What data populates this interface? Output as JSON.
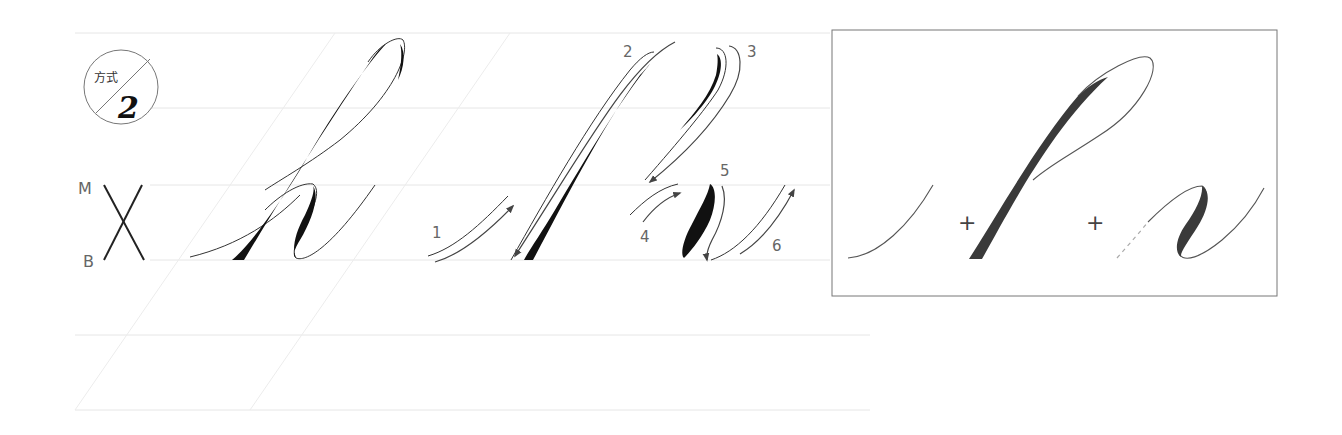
{
  "badge": {
    "method_label": "方式",
    "method_number": "2"
  },
  "guide_labels": {
    "midline": "M",
    "baseline": "B"
  },
  "stroke_order": {
    "steps": [
      "1",
      "2",
      "3",
      "4",
      "5",
      "6"
    ]
  },
  "composition": {
    "operators": [
      "+",
      "+"
    ]
  },
  "colors": {
    "ink": "#111111",
    "guide": "#e6e6e6",
    "box_border": "#777777",
    "label": "#666666"
  }
}
